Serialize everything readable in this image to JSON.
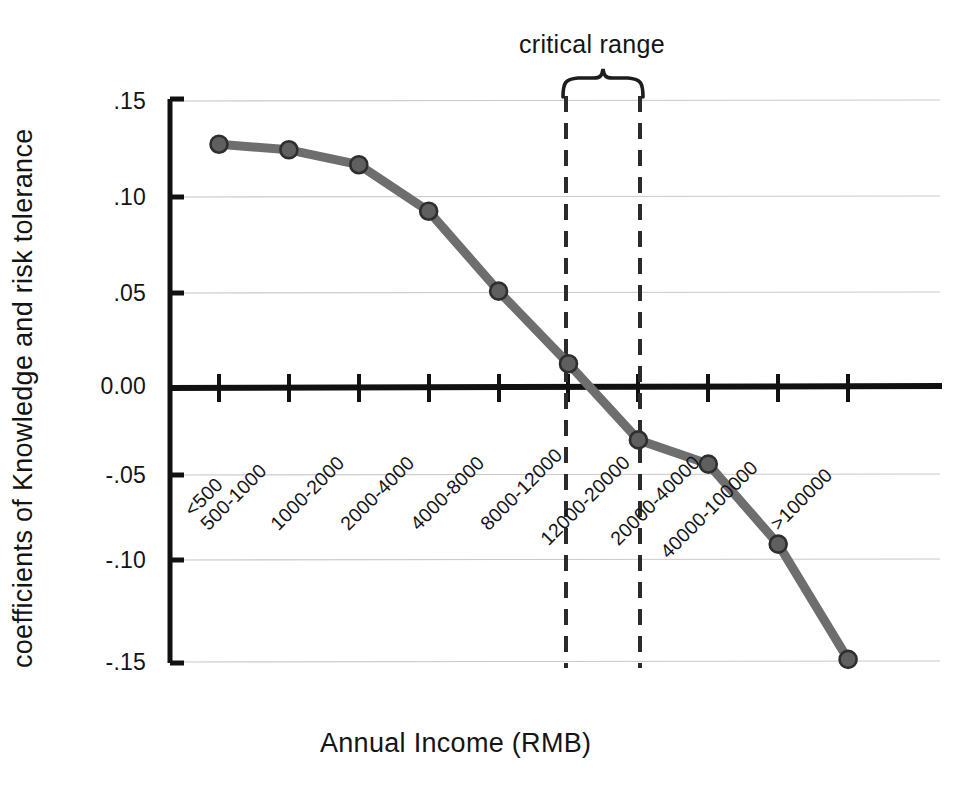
{
  "chart_data": {
    "type": "line",
    "title": "",
    "xlabel": "Annual Income (RMB)",
    "ylabel": "coefficients of Knowledge and risk tolerance",
    "categories": [
      "<500",
      "500-1000",
      "1000-2000",
      "2000-4000",
      "4000-8000",
      "8000-12000",
      "12000-20000",
      "20000-40000",
      "40000-100000",
      ">100000"
    ],
    "values": [
      0.13,
      0.127,
      0.119,
      0.094,
      0.051,
      0.012,
      -0.029,
      -0.042,
      -0.085,
      -0.147
    ],
    "series": [
      {
        "name": "coefficients of Knowledge and risk tolerance",
        "values": [
          0.13,
          0.127,
          0.119,
          0.094,
          0.051,
          0.012,
          -0.029,
          -0.042,
          -0.085,
          -0.147
        ]
      }
    ],
    "ylim": [
      -0.15,
      0.15
    ],
    "ytick_labels": [
      ".15",
      ".10",
      ".05",
      "0.00",
      "-.05",
      "-.10",
      "-.15"
    ],
    "ytick_values": [
      0.15,
      0.1,
      0.05,
      0.0,
      -0.05,
      -0.1,
      -0.15
    ],
    "grid": "horizontal",
    "legend": "none",
    "zero_line": 0.0,
    "annotations": [
      {
        "label": "critical range",
        "type": "brace-with-dashed-bounds",
        "from_category": "8000-12000",
        "to_category": "12000-20000"
      }
    ],
    "colors": {
      "line": "#6e6e6e",
      "marker_fill": "#5f5f5f",
      "marker_edge": "#2e2e2e",
      "axis": "#111111",
      "grid": "#c9c9c9",
      "text": "#141414"
    }
  },
  "axes": {
    "x_title": "Annual Income (RMB)",
    "y_title": "coefficients of Knowledge and risk tolerance"
  },
  "annotation": {
    "critical_range_label": "critical range"
  },
  "ticks": {
    "y": [
      {
        "label": ".15"
      },
      {
        "label": ".10"
      },
      {
        "label": ".05"
      },
      {
        "label": "0.00"
      },
      {
        "label": "-.05"
      },
      {
        "label": "-.10"
      },
      {
        "label": "-.15"
      }
    ],
    "x": [
      {
        "label": "<500"
      },
      {
        "label": "500-1000"
      },
      {
        "label": "1000-2000"
      },
      {
        "label": "2000-4000"
      },
      {
        "label": "4000-8000"
      },
      {
        "label": "8000-12000"
      },
      {
        "label": "12000-20000"
      },
      {
        "label": "20000-40000"
      },
      {
        "label": "40000-100000"
      },
      {
        "label": ">100000"
      }
    ]
  }
}
